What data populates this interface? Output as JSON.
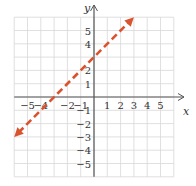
{
  "chart_data": {
    "type": "line",
    "title": "",
    "xlabel": "x",
    "ylabel": "y",
    "xlim": [
      -6,
      6
    ],
    "ylim": [
      -6,
      6
    ],
    "grid": true,
    "x_ticks": [
      -5,
      -4,
      -2,
      -1,
      1,
      2,
      3,
      4,
      5
    ],
    "x_tick_labels": [
      "−5",
      "−4",
      "−2",
      "−1",
      "1",
      "2",
      "3",
      "4",
      "5"
    ],
    "y_ticks": [
      5,
      4,
      2,
      1,
      -1,
      -2,
      -3,
      -4,
      -5
    ],
    "y_tick_labels": [
      "5",
      "4",
      "2",
      "1",
      "−1",
      "−2",
      "−3",
      "−4",
      "−5"
    ],
    "series": [
      {
        "name": "y = x + 3",
        "style": "dashed",
        "color": "#d9532f",
        "arrows": "both",
        "x": [
          -6,
          3
        ],
        "y": [
          -3,
          6
        ],
        "points_on_line": [
          [
            -3,
            0
          ],
          [
            0,
            3
          ]
        ]
      }
    ]
  },
  "colors": {
    "grid": "#d8d8d8",
    "axis": "#555555",
    "line": "#d9532f"
  }
}
